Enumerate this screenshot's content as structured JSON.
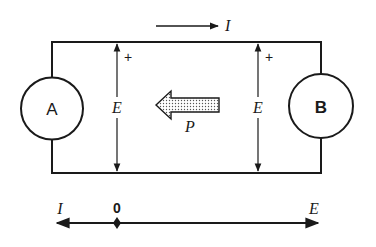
{
  "diagram": {
    "type": "circuit-power-flow",
    "colors": {
      "ink": "#1a1a1a",
      "background": "#ffffff",
      "dot_fill": "#999999"
    },
    "top_current": {
      "label": "I",
      "direction": "right"
    },
    "sources": [
      {
        "id": "A",
        "label": "A",
        "position": "left"
      },
      {
        "id": "B",
        "label": "B",
        "position": "right"
      }
    ],
    "voltages": [
      {
        "label": "E",
        "polarity": "+",
        "position": "left"
      },
      {
        "label": "E",
        "polarity": "+",
        "position": "right"
      }
    ],
    "power_flow": {
      "label": "P",
      "direction": "left"
    },
    "axis": {
      "left_label": "I",
      "origin_label": "0",
      "right_label": "E"
    }
  }
}
